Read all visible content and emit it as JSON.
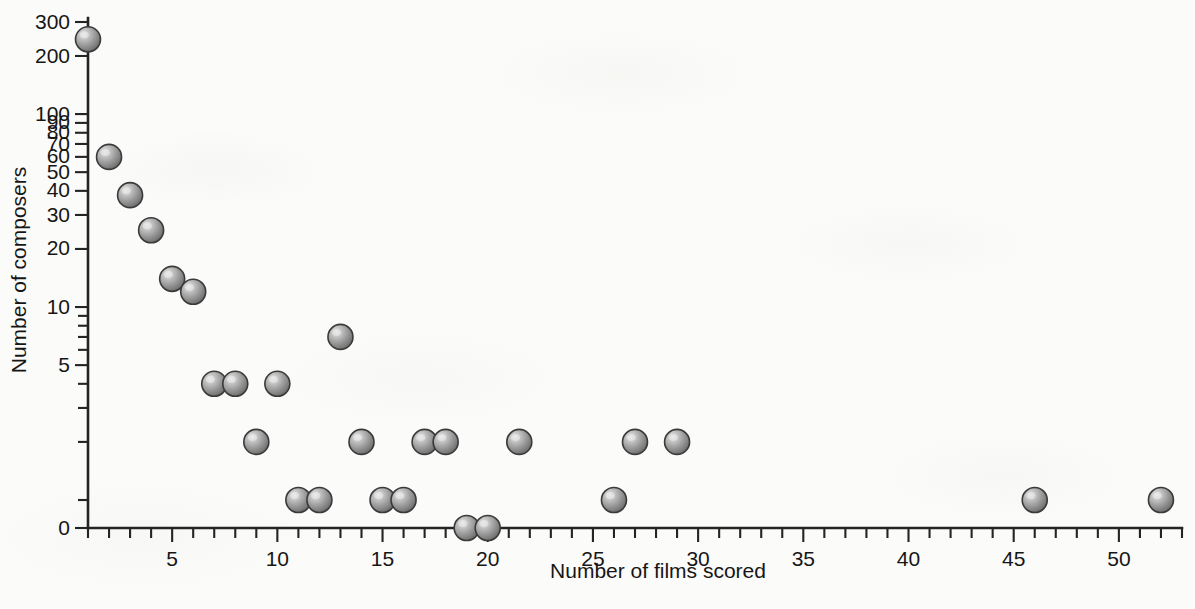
{
  "figure": {
    "background_color": "#fbfbf9",
    "ink_color": "#242424",
    "marker_color": "#8c8c8c",
    "marker_edge_color": "#3a3a3a",
    "marker_highlight_color": "#d9d9d9"
  },
  "chart_data": {
    "type": "scatter",
    "title": "",
    "xlabel": "Number of films scored",
    "ylabel": "Number of composers",
    "yscale": "log-like (0 placed below 1)",
    "xlim": [
      1,
      53
    ],
    "ylim": [
      0,
      300
    ],
    "grid": false,
    "legend": null,
    "x_major_ticks": [
      5,
      10,
      15,
      20,
      25,
      30,
      35,
      40,
      45,
      50
    ],
    "x_major_tick_labels": [
      "5",
      "10",
      "15",
      "20",
      "25",
      "30",
      "35",
      "40",
      "45",
      "50"
    ],
    "x_minor_tick_step": 1,
    "y_ticks": [
      0,
      1,
      2,
      3,
      4,
      5,
      6,
      7,
      8,
      9,
      10,
      20,
      30,
      40,
      50,
      60,
      70,
      80,
      90,
      100,
      200,
      300
    ],
    "y_tick_labels": {
      "0": "0",
      "5": "5",
      "10": "10",
      "20": "20",
      "30": "30",
      "40": "40",
      "50": "50",
      "60": "60",
      "70": "70",
      "80": "80",
      "90": "90",
      "100": "100",
      "200": "200",
      "300": "300"
    },
    "points": [
      {
        "x": 1,
        "y": 244
      },
      {
        "x": 2,
        "y": 60
      },
      {
        "x": 3,
        "y": 38
      },
      {
        "x": 4,
        "y": 25
      },
      {
        "x": 5,
        "y": 14
      },
      {
        "x": 6,
        "y": 12
      },
      {
        "x": 7,
        "y": 4
      },
      {
        "x": 8,
        "y": 4
      },
      {
        "x": 9,
        "y": 2
      },
      {
        "x": 10,
        "y": 4
      },
      {
        "x": 11,
        "y": 1
      },
      {
        "x": 12,
        "y": 1
      },
      {
        "x": 13,
        "y": 7
      },
      {
        "x": 14,
        "y": 2
      },
      {
        "x": 15,
        "y": 1
      },
      {
        "x": 16,
        "y": 1
      },
      {
        "x": 17,
        "y": 2
      },
      {
        "x": 18,
        "y": 2
      },
      {
        "x": 19,
        "y": 0
      },
      {
        "x": 20,
        "y": 0
      },
      {
        "x": 21.5,
        "y": 2
      },
      {
        "x": 26,
        "y": 1
      },
      {
        "x": 27,
        "y": 2
      },
      {
        "x": 29,
        "y": 2
      },
      {
        "x": 46,
        "y": 1
      },
      {
        "x": 52,
        "y": 1
      }
    ]
  }
}
